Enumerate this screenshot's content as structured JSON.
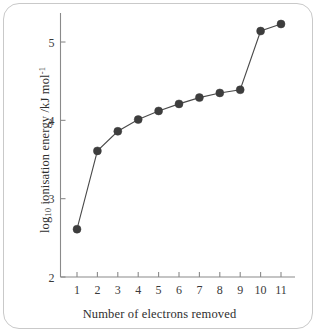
{
  "chart_data": {
    "type": "line",
    "title": "",
    "subtitle": "",
    "xlabel": "Number of electrons removed",
    "ylabel_html": "log<sub>10</sub> ionisation energy /kJ mol<sup>-1</sup>",
    "ylabel_text": "log10 ionisation energy /kJ mol-1",
    "x": [
      1,
      2,
      3,
      4,
      5,
      6,
      7,
      8,
      9,
      10,
      11
    ],
    "values": [
      2.61,
      3.61,
      3.86,
      4.01,
      4.12,
      4.21,
      4.29,
      4.35,
      4.39,
      5.14,
      5.23
    ],
    "series": [
      {
        "name": "log10 ionisation energy",
        "values": [
          2.61,
          3.61,
          3.86,
          4.01,
          4.12,
          4.21,
          4.29,
          4.35,
          4.39,
          5.14,
          5.23
        ]
      }
    ],
    "xticks": [
      "1",
      "2",
      "3",
      "4",
      "5",
      "6",
      "7",
      "8",
      "9",
      "10",
      "11"
    ],
    "xtick_values": [
      1,
      2,
      3,
      4,
      5,
      6,
      7,
      8,
      9,
      10,
      11
    ],
    "yticks": [
      "2",
      "3",
      "4",
      "5"
    ],
    "ytick_values": [
      2,
      3,
      4,
      5
    ],
    "xlim": [
      0.6,
      11.7
    ],
    "ylim": [
      2.0,
      5.37
    ],
    "grid": false,
    "legend": false,
    "legend_position": "none",
    "marker": "filled-circle",
    "marker_color": "#3d3d3d",
    "line_color": "#4a4a4a",
    "axis_color": "#8a8a8a",
    "background_color": "#ffffff",
    "frame_color": "#c9c9c9",
    "annotations": []
  }
}
